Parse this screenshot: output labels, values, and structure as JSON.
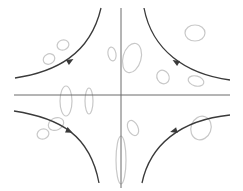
{
  "diagram": {
    "type": "phase-portrait-saddle",
    "colors": {
      "background": "#ffffff",
      "axis": "#6a6a6a",
      "trajectory": "#3a3a3a",
      "blob": "#c8c8c8"
    },
    "axes": {
      "horizontal": {
        "x1": 14,
        "y1": 95,
        "x2": 230,
        "y2": 95
      },
      "vertical": {
        "x1": 121,
        "y1": 8,
        "x2": 121,
        "y2": 188
      }
    },
    "trajectories": [
      {
        "name": "trajectory-top-left",
        "path": "M15,78 C55,72 90,55 101,8",
        "arrow": {
          "x": 70,
          "y": 61,
          "angle": -30
        }
      },
      {
        "name": "trajectory-top-right",
        "path": "M144,8 C152,50 185,74 230,80",
        "arrow": {
          "x": 176,
          "y": 62,
          "angle": 210
        }
      },
      {
        "name": "trajectory-bottom-left",
        "path": "M14,111 C60,118 90,135 99,183",
        "arrow": {
          "x": 69,
          "y": 131,
          "angle": 25
        }
      },
      {
        "name": "trajectory-bottom-right",
        "path": "M230,115 C180,120 150,145 142,183",
        "arrow": {
          "x": 174,
          "y": 131,
          "angle": 165
        }
      }
    ],
    "blobs": [
      {
        "cx": 63,
        "cy": 45,
        "rx": 6,
        "ry": 5,
        "rot": -20
      },
      {
        "cx": 49,
        "cy": 59,
        "rx": 6,
        "ry": 5,
        "rot": -30
      },
      {
        "cx": 112,
        "cy": 54,
        "rx": 4,
        "ry": 7,
        "rot": -10
      },
      {
        "cx": 132,
        "cy": 58,
        "rx": 9,
        "ry": 15,
        "rot": 15
      },
      {
        "cx": 195,
        "cy": 33,
        "rx": 10,
        "ry": 8,
        "rot": 0
      },
      {
        "cx": 163,
        "cy": 77,
        "rx": 6,
        "ry": 7,
        "rot": -30
      },
      {
        "cx": 196,
        "cy": 81,
        "rx": 8,
        "ry": 5,
        "rot": 15
      },
      {
        "cx": 66,
        "cy": 101,
        "rx": 6,
        "ry": 15,
        "rot": 0
      },
      {
        "cx": 89,
        "cy": 101,
        "rx": 4,
        "ry": 13,
        "rot": 0
      },
      {
        "cx": 56,
        "cy": 124,
        "rx": 8,
        "ry": 6,
        "rot": -25
      },
      {
        "cx": 43,
        "cy": 134,
        "rx": 6,
        "ry": 5,
        "rot": -20
      },
      {
        "cx": 133,
        "cy": 128,
        "rx": 5,
        "ry": 8,
        "rot": -25
      },
      {
        "cx": 201,
        "cy": 128,
        "rx": 10,
        "ry": 12,
        "rot": 20
      },
      {
        "cx": 121,
        "cy": 160,
        "rx": 5,
        "ry": 24,
        "rot": 0
      }
    ]
  }
}
